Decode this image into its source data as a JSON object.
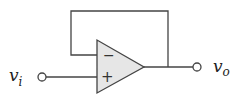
{
  "diagram": {
    "opamp": {
      "inverting_symbol": "−",
      "noninverting_symbol": "+",
      "fill": "#e6e6e6",
      "stroke": "#444444"
    },
    "input": {
      "label_main": "v",
      "label_sub": "i"
    },
    "output": {
      "label_main": "v",
      "label_sub": "o"
    },
    "wire_color": "#444444"
  }
}
